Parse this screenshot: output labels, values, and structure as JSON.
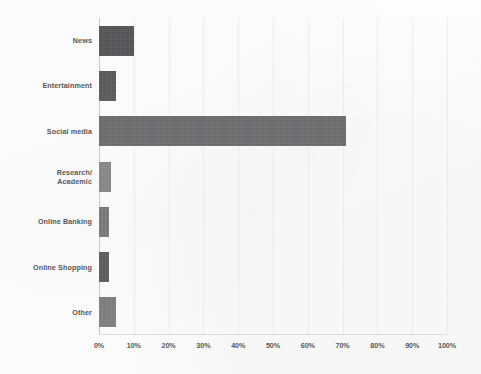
{
  "chart_data": {
    "type": "bar",
    "orientation": "horizontal",
    "title": "",
    "subtitle": "",
    "xlabel": "",
    "ylabel": "",
    "categories": [
      "News",
      "Entertainment",
      "Social media",
      "Research/\nAcademic",
      "Online Banking",
      "Online Shopping",
      "Other"
    ],
    "values": [
      10,
      5,
      71,
      3.5,
      3,
      3,
      5
    ],
    "value_suffix": "%",
    "xlim": [
      0,
      100
    ],
    "xticks": [
      0,
      10,
      20,
      30,
      40,
      50,
      60,
      70,
      80,
      90,
      100
    ],
    "xtick_labels": [
      "0%",
      "10%",
      "20%",
      "30%",
      "40%",
      "50%",
      "60%",
      "70%",
      "80%",
      "90%",
      "100%"
    ],
    "grid": false,
    "legend": false,
    "legend_position": "none",
    "bar_color": "#5f5f61",
    "bar_colors": [
      "#57575a",
      "#5c5c5f",
      "#6e6e70",
      "#8a8a8c",
      "#7d7d80",
      "#5f5f62",
      "#818183"
    ],
    "axis_color": "#c9c9c9",
    "label_color": "#575757",
    "background_color": "#fdfdfd"
  }
}
